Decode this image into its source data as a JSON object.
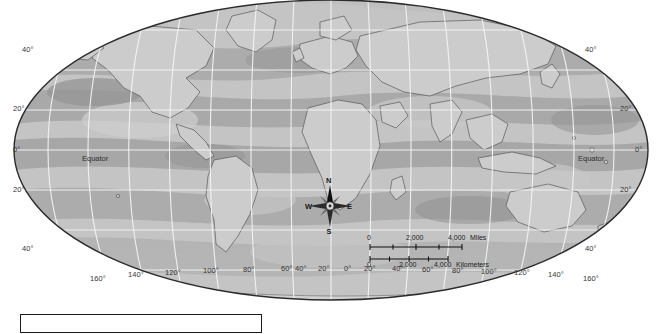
{
  "map": {
    "projection": "mollweide-elliptical",
    "title": "",
    "graticule_interval_deg": 20,
    "colors": {
      "background": "#ffffff",
      "ocean_light": "#c9c9c9",
      "ocean_mid": "#b3b3b3",
      "ocean_dark": "#9a9a9a",
      "land_light": "#cccccc",
      "land_outline": "#4a4a4a",
      "ellipse_outline": "#2b2b2b",
      "graticule": "#f2f2f2",
      "text": "#333333"
    },
    "equator_label_left": "Equator",
    "equator_label_right": "Equator",
    "latitude_labels_left": [
      "40°",
      "20°",
      "0°",
      "20°",
      "40°"
    ],
    "latitude_labels_right": [
      "40°",
      "20°",
      "0°",
      "20°",
      "40°"
    ],
    "longitude_labels": [
      "160°",
      "140°",
      "120°",
      "100°",
      "80°",
      "60°",
      "40°",
      "20°",
      "0°",
      "20°",
      "40°",
      "60°",
      "80°",
      "100°",
      "120°",
      "140°",
      "160°"
    ]
  },
  "compass": {
    "north": "N",
    "east": "E",
    "south": "S",
    "west": "W"
  },
  "scale": {
    "miles": {
      "unit": "Miles",
      "ticks": [
        "0",
        "2,000",
        "4,000"
      ]
    },
    "kilometers": {
      "unit": "Kilometers",
      "ticks": [
        "0",
        "2,000",
        "4,000"
      ]
    }
  },
  "legend": {
    "caption": ""
  }
}
